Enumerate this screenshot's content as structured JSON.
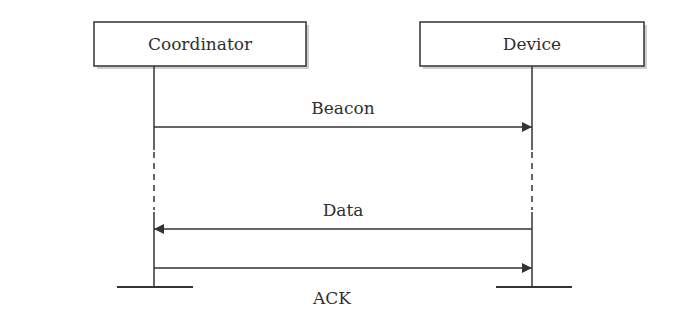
{
  "diagram": {
    "type": "sequence",
    "participants": [
      {
        "id": "coordinator",
        "label": "Coordinator"
      },
      {
        "id": "device",
        "label": "Device"
      }
    ],
    "messages": [
      {
        "label": "Beacon",
        "from": "coordinator",
        "to": "device"
      },
      {
        "label": "Data",
        "from": "device",
        "to": "coordinator"
      },
      {
        "label": "ACK",
        "from": "coordinator",
        "to": "device"
      }
    ],
    "colors": {
      "line": "#333333",
      "box_fill": "#ffffff",
      "box_shadow": "#c8c8c8",
      "text": "#2f2f2f"
    }
  }
}
